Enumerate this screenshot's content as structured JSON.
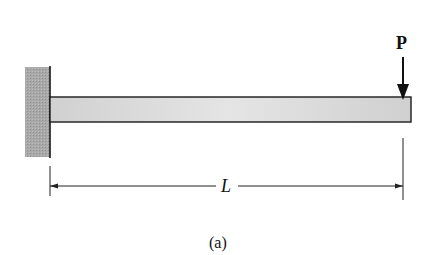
{
  "figure": {
    "type": "cantilever-beam",
    "load_label": "P",
    "length_label": "L",
    "caption": "(a)"
  },
  "colors": {
    "wall_fill": "#a8a8a8",
    "beam_fill": "#d6d6d6",
    "stroke": "#1a1a1a"
  }
}
